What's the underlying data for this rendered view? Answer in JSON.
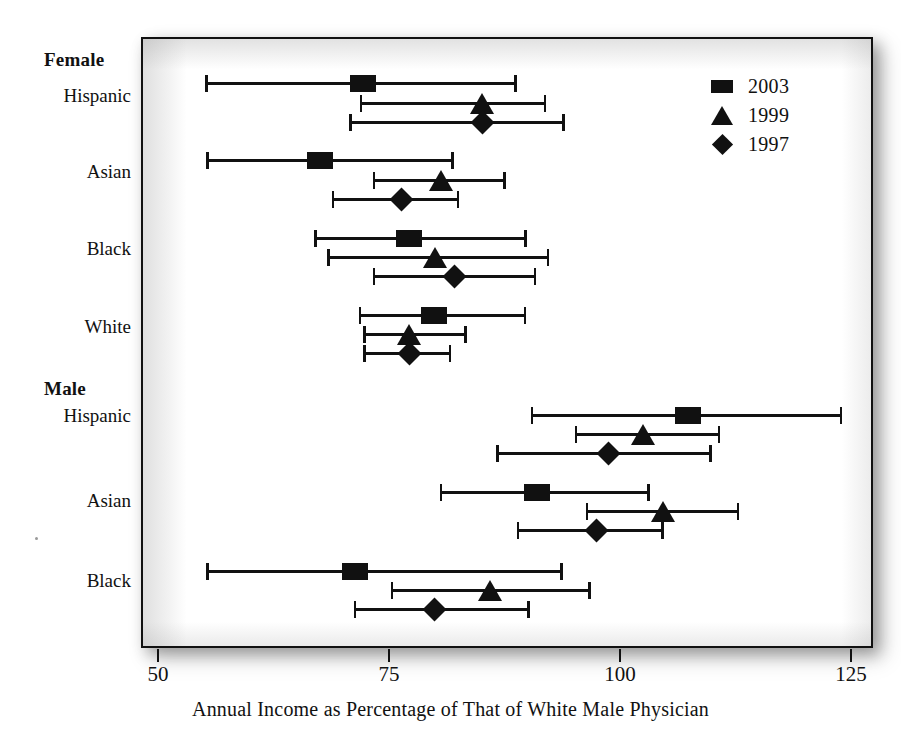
{
  "chart_data": {
    "type": "scatter",
    "subtype": "forest-plot-with-error-bars",
    "title": "",
    "xlabel": "Annual Income as Percentage of That of White Male Physician",
    "ylabel": "",
    "xlim": [
      50,
      125
    ],
    "xticks": [
      50,
      75,
      100,
      125
    ],
    "xtick_labels": [
      "50",
      "75",
      "100",
      "125"
    ],
    "grid": false,
    "legend_position": "top-right",
    "legend": [
      {
        "label": "2003",
        "marker": "square"
      },
      {
        "label": "1999",
        "marker": "triangle"
      },
      {
        "label": "1997",
        "marker": "diamond"
      }
    ],
    "series": [
      {
        "name": "2003",
        "marker": "square"
      },
      {
        "name": "1999",
        "marker": "triangle"
      },
      {
        "name": "1997",
        "marker": "diamond"
      }
    ],
    "groups": [
      {
        "name": "Female",
        "categories": [
          {
            "label": "Hispanic",
            "points": [
              {
                "series": "2003",
                "value": 72.0,
                "low": 54.9,
                "high": 88.6
              },
              {
                "series": "1999",
                "value": 84.9,
                "low": 71.6,
                "high": 91.8
              },
              {
                "series": "1997",
                "value": 84.9,
                "low": 70.5,
                "high": 93.8
              }
            ]
          },
          {
            "label": "Asian",
            "points": [
              {
                "series": "2003",
                "value": 67.3,
                "low": 55.0,
                "high": 81.8
              },
              {
                "series": "1999",
                "value": 80.4,
                "low": 73.0,
                "high": 87.4
              },
              {
                "series": "1997",
                "value": 76.1,
                "low": 68.6,
                "high": 82.4
              }
            ]
          },
          {
            "label": "Black",
            "points": [
              {
                "series": "2003",
                "value": 77.0,
                "low": 66.7,
                "high": 89.7
              },
              {
                "series": "1999",
                "value": 79.8,
                "low": 68.1,
                "high": 92.1
              },
              {
                "series": "1997",
                "value": 81.9,
                "local_note": "",
                "low": 73.0,
                "high": 90.7
              }
            ]
          },
          {
            "label": "White",
            "points": [
              {
                "series": "2003",
                "value": 79.7,
                "low": 71.5,
                "high": 89.6
              },
              {
                "series": "1999",
                "value": 77.0,
                "low": 72.0,
                "high": 83.2
              },
              {
                "series": "1997",
                "value": 77.0,
                "low": 72.0,
                "high": 81.5
              }
            ]
          }
        ]
      },
      {
        "name": "Male",
        "categories": [
          {
            "label": "Hispanic",
            "points": [
              {
                "series": "2003",
                "value": 107.1,
                "low": 90.1,
                "high": 123.8
              },
              {
                "series": "1999",
                "value": 102.3,
                "low": 94.9,
                "high": 110.6
              },
              {
                "series": "1997",
                "value": 98.5,
                "low": 86.4,
                "high": 109.7
              }
            ]
          },
          {
            "label": "Asian",
            "points": [
              {
                "series": "2003",
                "value": 90.8,
                "low": 80.3,
                "high": 103.0
              },
              {
                "series": "1999",
                "value": 104.4,
                "low": 96.1,
                "high": 112.7
              },
              {
                "series": "1997",
                "value": 97.2,
                "low": 88.6,
                "high": 104.5
              }
            ]
          },
          {
            "label": "Black",
            "points": [
              {
                "series": "2003",
                "value": 71.1,
                "low": 55.0,
                "high": 93.6
              },
              {
                "series": "1999",
                "value": 85.7,
                "low": 75.0,
                "high": 96.6
              },
              {
                "series": "1997",
                "value": 79.7,
                "low": 71.0,
                "high": 90.0
              }
            ]
          }
        ]
      }
    ]
  },
  "axis": {
    "tick_labels": [
      "50",
      "75",
      "100",
      "125"
    ],
    "title": "Annual Income as Percentage of That of White Male Physician"
  },
  "legend": {
    "items": [
      {
        "label": "2003"
      },
      {
        "label": "1999"
      },
      {
        "label": "1997"
      }
    ]
  },
  "row_labels": {
    "female_group": "Female",
    "female_hispanic": "Hispanic",
    "female_asian": "Asian",
    "female_black": "Black",
    "female_white": "White",
    "male_group": "Male",
    "male_hispanic": "Hispanic",
    "male_asian": "Asian",
    "male_black": "Black"
  },
  "colors": {
    "ink": "#111111",
    "page": "#ffffff",
    "frame_shadow": "#8c8c8c"
  }
}
